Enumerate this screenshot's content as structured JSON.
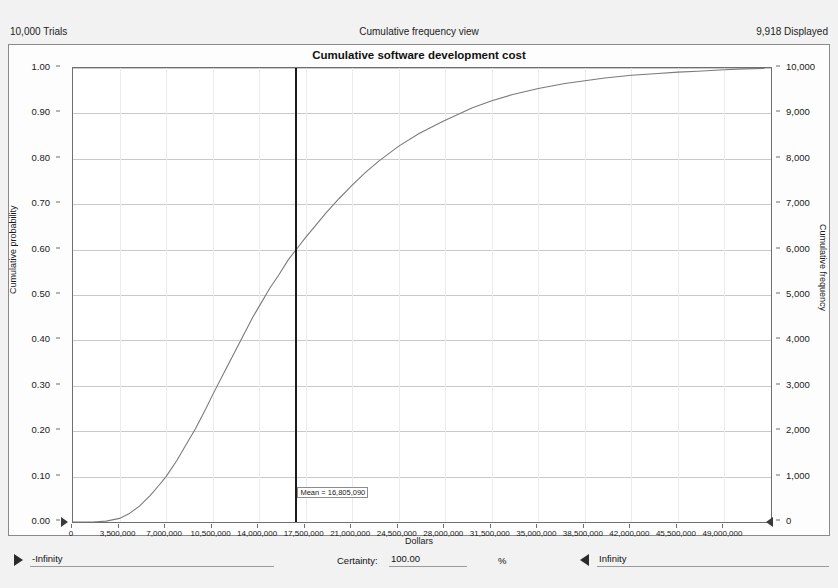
{
  "window": {
    "trials_label": "10,000 Trials",
    "view_label": "Cumulative frequency view",
    "displayed_label": "9,918 Displayed"
  },
  "chart_data": {
    "type": "line",
    "title": "Cumulative software development cost",
    "xlabel": "Dollars",
    "ylabel": "Cumulative probability",
    "y2label": "Cumulative frequency",
    "grid": true,
    "legend": "none",
    "xlim": [
      0,
      52500000
    ],
    "ylim": [
      0,
      1
    ],
    "y2lim": [
      0,
      10000
    ],
    "xticks": [
      "0",
      "3,500,000",
      "7,000,000",
      "10,500,000",
      "14,000,000",
      "17,500,000",
      "21,000,000",
      "24,500,000",
      "28,000,000",
      "31,500,000",
      "35,000,000",
      "38,500,000",
      "42,000,000",
      "45,500,000",
      "49,000,000"
    ],
    "xtick_values": [
      0,
      3500000,
      7000000,
      10500000,
      14000000,
      17500000,
      21000000,
      24500000,
      28000000,
      31500000,
      35000000,
      38500000,
      42000000,
      45500000,
      49000000
    ],
    "yticks": [
      "0.00",
      "0.10",
      "0.20",
      "0.30",
      "0.40",
      "0.50",
      "0.60",
      "0.70",
      "0.80",
      "0.90",
      "1.00"
    ],
    "ytick_values": [
      0,
      0.1,
      0.2,
      0.3,
      0.4,
      0.5,
      0.6,
      0.7,
      0.8,
      0.9,
      1.0
    ],
    "y2ticks": [
      "0",
      "1,000",
      "2,000",
      "3,000",
      "4,000",
      "5,000",
      "6,000",
      "7,000",
      "8,000",
      "9,000",
      "10,000"
    ],
    "y2tick_values": [
      0,
      1000,
      2000,
      3000,
      4000,
      5000,
      6000,
      7000,
      8000,
      9000,
      10000
    ],
    "series": [
      {
        "name": "Cumulative probability",
        "color": "#7a7a7a",
        "x": [
          0,
          1500000,
          2500000,
          3500000,
          4200000,
          5000000,
          5800000,
          6500000,
          7000000,
          7800000,
          8500000,
          9200000,
          10000000,
          10500000,
          11200000,
          12000000,
          12800000,
          13500000,
          14000000,
          14800000,
          15500000,
          16200000,
          17000000,
          17500000,
          18300000,
          19000000,
          20000000,
          21000000,
          22000000,
          23000000,
          24500000,
          26000000,
          27500000,
          28000000,
          30000000,
          31500000,
          33000000,
          35000000,
          37000000,
          38500000,
          40000000,
          42000000,
          44000000,
          45500000,
          47000000,
          49000000,
          50500000,
          52000000
        ],
        "y": [
          0.0,
          0.0,
          0.002,
          0.008,
          0.018,
          0.035,
          0.058,
          0.082,
          0.1,
          0.135,
          0.17,
          0.205,
          0.25,
          0.28,
          0.32,
          0.365,
          0.41,
          0.45,
          0.475,
          0.515,
          0.545,
          0.578,
          0.608,
          0.627,
          0.655,
          0.68,
          0.712,
          0.742,
          0.77,
          0.795,
          0.828,
          0.855,
          0.878,
          0.885,
          0.912,
          0.928,
          0.941,
          0.955,
          0.966,
          0.972,
          0.978,
          0.984,
          0.988,
          0.991,
          0.993,
          0.996,
          0.998,
          0.999
        ]
      }
    ],
    "annotations": [
      {
        "name": "mean-marker",
        "label": "Mean = 16,805,090",
        "x": 16805090,
        "type": "vertical-line",
        "color": "#1b1b1b"
      }
    ]
  },
  "controls": {
    "left_bound_value": "-Infinity",
    "right_bound_value": "Infinity",
    "certainty_label": "Certainty:",
    "certainty_value": "100.00",
    "percent_symbol": "%"
  }
}
